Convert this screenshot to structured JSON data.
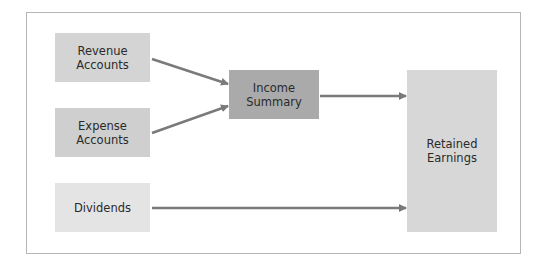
{
  "diagram": {
    "nodes": {
      "revenue": {
        "label": "Revenue\nAccounts",
        "color": "#d4d4d4"
      },
      "expense": {
        "label": "Expense\nAccounts",
        "color": "#cfcfcf"
      },
      "dividends": {
        "label": "Dividends",
        "color": "#e4e4e4"
      },
      "income_summary": {
        "label": "Income\nSummary",
        "color": "#aaaaaa"
      },
      "retained_earnings": {
        "label": "Retained\nEarnings",
        "color": "#d7d7d7"
      }
    },
    "edges": [
      {
        "from": "Revenue Accounts",
        "to": "Income Summary"
      },
      {
        "from": "Expense Accounts",
        "to": "Income Summary"
      },
      {
        "from": "Income Summary",
        "to": "Retained Earnings"
      },
      {
        "from": "Dividends",
        "to": "Retained Earnings"
      }
    ],
    "arrow_color": "#7a7a7a"
  }
}
